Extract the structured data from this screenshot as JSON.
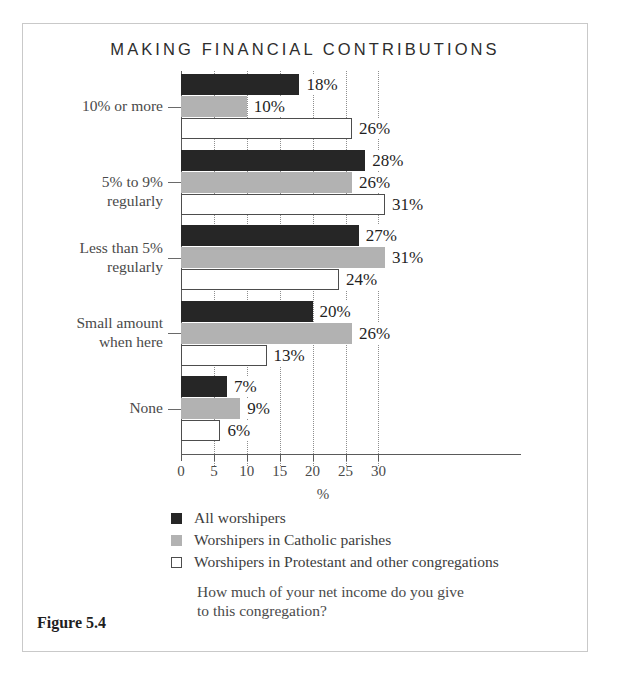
{
  "figure": {
    "number_label": "Figure 5.4",
    "question": "How much of your net income do you give\nto this congregation?"
  },
  "chart_data": {
    "type": "bar",
    "orientation": "horizontal",
    "title": "MAKING FINANCIAL CONTRIBUTIONS",
    "xlabel": "%",
    "ylabel": "",
    "xlim": [
      0,
      33
    ],
    "xticks": [
      0,
      5,
      10,
      15,
      20,
      25,
      30
    ],
    "xtick_labels": [
      "0",
      "5",
      "10",
      "15",
      "20",
      "25",
      "30"
    ],
    "grid": "vertical-dotted",
    "legend_position": "below",
    "categories": [
      "10% or more",
      "5% to 9% regularly",
      "Less than 5%\nregularly",
      "Small amount\nwhen here",
      "None"
    ],
    "series": [
      {
        "name": "All worshipers",
        "color": "#262626",
        "values": [
          18,
          28,
          27,
          20,
          7
        ],
        "value_labels": [
          "18%",
          "28%",
          "27%",
          "20%",
          "7%"
        ]
      },
      {
        "name": "Worshipers in Catholic parishes",
        "color": "#b2b2b2",
        "values": [
          10,
          26,
          31,
          26,
          9
        ],
        "value_labels": [
          "10%",
          "26%",
          "31%",
          "26%",
          "9%"
        ]
      },
      {
        "name": "Worshipers in Protestant and other congregations",
        "color": "#ffffff",
        "values": [
          26,
          31,
          24,
          13,
          6
        ],
        "value_labels": [
          "26%",
          "31%",
          "24%",
          "13%",
          "6%"
        ]
      }
    ]
  }
}
